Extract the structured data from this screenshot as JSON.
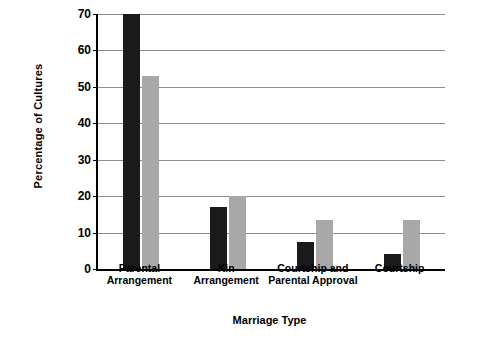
{
  "chart_data": {
    "type": "bar",
    "title": "",
    "xlabel": "Marriage Type",
    "ylabel": "Percentage of Cultures",
    "categories": [
      "Parental\nArrangement",
      "Kin\nArrangement",
      "Courtship and\nParental Approval",
      "Courtship"
    ],
    "category_labels": [
      [
        "Parental",
        "Arrangement"
      ],
      [
        "Kin",
        "Arrangement"
      ],
      [
        "Courtship and",
        "Parental Approval"
      ],
      [
        "Courtship"
      ]
    ],
    "series": [
      {
        "name": "series-1",
        "color": "#1a1a1a",
        "values": [
          70,
          17,
          7.5,
          4
        ]
      },
      {
        "name": "series-2",
        "color": "#a8a8a8",
        "values": [
          53,
          20,
          13.5,
          13.5
        ]
      }
    ],
    "yticks": [
      0,
      10,
      20,
      30,
      40,
      50,
      60,
      70
    ],
    "ylim": [
      0,
      70
    ],
    "grid": true,
    "legend": "none"
  }
}
